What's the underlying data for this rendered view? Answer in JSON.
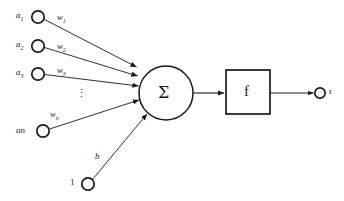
{
  "diagram": {
    "colors": {
      "stroke": "#1a1a1a",
      "background": "#ffffff",
      "text": "#1a1a1a"
    },
    "inputs": [
      {
        "id": "a1",
        "base": "a",
        "sub": "1",
        "weight_base": "w",
        "weight_sub": "1"
      },
      {
        "id": "a2",
        "base": "a",
        "sub": "2",
        "weight_base": "w",
        "weight_sub": "2"
      },
      {
        "id": "a3",
        "base": "a",
        "sub": "3",
        "weight_base": "w",
        "weight_sub": "3"
      },
      {
        "id": "an",
        "base": "an",
        "sub": "",
        "weight_base": "w",
        "weight_sub": "n"
      }
    ],
    "ellipsis": "⋮",
    "bias": {
      "constant_label": "1",
      "weight_label": "b"
    },
    "summation": {
      "symbol": "Σ"
    },
    "activation": {
      "symbol": "f"
    },
    "output": {
      "label": "t"
    }
  }
}
